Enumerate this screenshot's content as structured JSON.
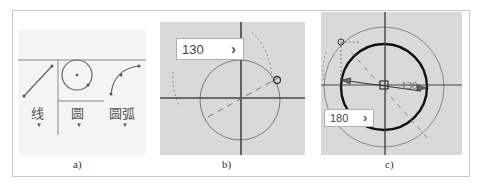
{
  "panels": {
    "a": {
      "caption": "a)",
      "tools": [
        {
          "label": "线",
          "icon": "line-icon"
        },
        {
          "label": "圆",
          "icon": "circle-icon"
        },
        {
          "label": "圆弧",
          "icon": "arc-icon"
        }
      ],
      "dropdown_glyph": "▼"
    },
    "b": {
      "caption": "b)",
      "input_value": "130",
      "enter_glyph": "›"
    },
    "c": {
      "caption": "c)",
      "input_value": "180",
      "dimension_label": "130",
      "enter_glyph": "›"
    }
  },
  "colors": {
    "canvas_bg": "#d9d9d9",
    "axis": "#333333",
    "circle_thin": "#888888",
    "circle_bold": "#111111"
  }
}
